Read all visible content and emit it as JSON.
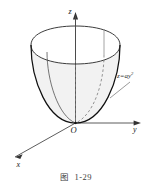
{
  "figure": {
    "caption": "图  1-29",
    "caption_number": "1-29",
    "axes": {
      "z_label": "z",
      "y_label": "y",
      "x_label": "x",
      "origin_label": "O"
    },
    "surface": {
      "equation_base": "z=ay",
      "equation_exponent": "2",
      "equation_full": "z=ay²",
      "name": "paraboloid-of-revolution"
    },
    "colors": {
      "outline": "#1a1a1a",
      "surface_fill": "#f2f2f2",
      "hidden_curve": "#7a7a7a",
      "axis": "#4a4a4a",
      "leader": "#6e6e6e",
      "background": "#ffffff",
      "caption_text": "#3d3d3d"
    }
  }
}
